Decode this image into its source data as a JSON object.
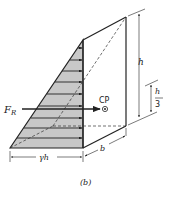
{
  "diagram": {
    "caption": "(b)",
    "labels": {
      "force": "F",
      "force_sub": "R",
      "center_of_pressure": "CP",
      "height": "h",
      "third_num": "h",
      "third_den": "3",
      "base_pressure": "γh",
      "width": "b"
    },
    "colors": {
      "fill": "#c8c8c8",
      "stroke": "#222222"
    }
  }
}
